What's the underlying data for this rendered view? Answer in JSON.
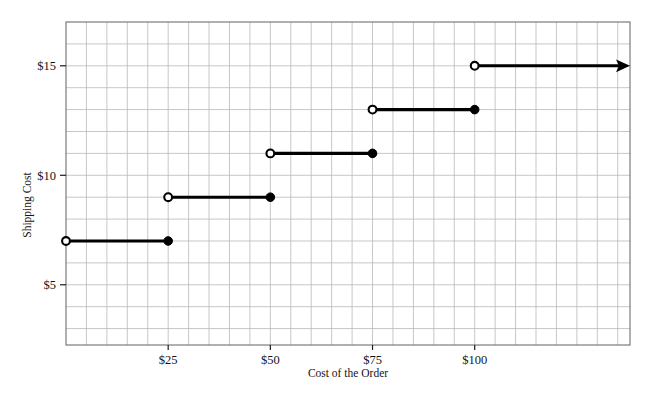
{
  "chart_data": {
    "type": "line",
    "subtype": "step-function",
    "title": "",
    "xlabel": "Cost of the Order",
    "ylabel": "Shipping Cost",
    "xlim": [
      0,
      138
    ],
    "ylim": [
      2.25,
      17.0
    ],
    "grid": true,
    "grid_spacing_x": 5,
    "grid_spacing_y": 1,
    "legend": "none",
    "xticks": [
      25,
      50,
      75,
      100
    ],
    "xticklabels": [
      "$25",
      "$50",
      "$75",
      "$100"
    ],
    "yticks": [
      5,
      10,
      15
    ],
    "yticklabels": [
      "$5",
      "$10",
      "$15"
    ],
    "steps": [
      {
        "x_start": 0,
        "x_end": 25,
        "y": 7,
        "left_endpoint": "open",
        "right_endpoint": "closed",
        "arrow": false
      },
      {
        "x_start": 25,
        "x_end": 50,
        "y": 9,
        "left_endpoint": "open",
        "right_endpoint": "closed",
        "arrow": false
      },
      {
        "x_start": 50,
        "x_end": 75,
        "y": 11,
        "left_endpoint": "open",
        "right_endpoint": "closed",
        "arrow": false
      },
      {
        "x_start": 75,
        "x_end": 100,
        "y": 13,
        "left_endpoint": "open",
        "right_endpoint": "closed",
        "arrow": false
      },
      {
        "x_start": 100,
        "x_end": 138,
        "y": 15,
        "left_endpoint": "open",
        "right_endpoint": "arrow",
        "arrow": true
      }
    ],
    "colors": {
      "line": "#000000",
      "grid": "#b9b9bd",
      "border": "#6f6f75",
      "text": "#141414",
      "background": "#ffffff"
    }
  }
}
